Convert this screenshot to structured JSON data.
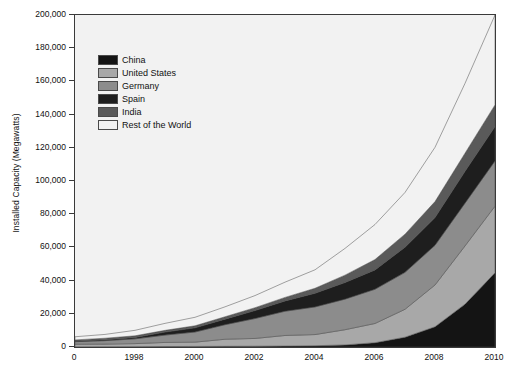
{
  "chart_data": {
    "type": "area",
    "title": "",
    "subtitle": "",
    "xlabel": "",
    "ylabel": "Installed Capacity (Megawatts)",
    "stacked": true,
    "grid": false,
    "legend_position": "inside-top-left",
    "xlim": [
      1996,
      2010
    ],
    "ylim": [
      0,
      200000
    ],
    "x": [
      1996,
      1997,
      1998,
      1999,
      2000,
      2001,
      2002,
      2003,
      2004,
      2005,
      2006,
      2007,
      2008,
      2009,
      2010
    ],
    "xtick_labels": [
      "0",
      "1998",
      "2000",
      "2002",
      "2004",
      "2006",
      "2008",
      "2010"
    ],
    "xtick_values": [
      1996,
      1998,
      2000,
      2002,
      2004,
      2006,
      2008,
      2010
    ],
    "ytick_labels": [
      "0",
      "20,000",
      "40,000",
      "60,000",
      "80,000",
      "100,000",
      "120,000",
      "140,000",
      "160,000",
      "180,000",
      "200,000"
    ],
    "ytick_values": [
      0,
      20000,
      40000,
      60000,
      80000,
      100000,
      120000,
      140000,
      160000,
      180000,
      200000
    ],
    "series": [
      {
        "name": "China",
        "color": "#141414",
        "values": [
          79,
          146,
          224,
          268,
          346,
          402,
          469,
          567,
          764,
          1266,
          2599,
          5912,
          12200,
          25800,
          44700
        ]
      },
      {
        "name": "United States",
        "color": "#a8a8a8",
        "values": [
          1596,
          1611,
          1820,
          2473,
          2578,
          4275,
          4685,
          6372,
          6725,
          9149,
          11575,
          16819,
          25170,
          35086,
          40180
        ]
      },
      {
        "name": "Germany",
        "color": "#8c8c8c",
        "values": [
          1546,
          2081,
          2875,
          4442,
          6097,
          8754,
          11994,
          14609,
          16629,
          18415,
          20622,
          22247,
          23903,
          25777,
          27214
        ]
      },
      {
        "name": "Spain",
        "color": "#1e1e1e",
        "values": [
          249,
          512,
          834,
          1812,
          2535,
          3337,
          4825,
          6203,
          8264,
          10028,
          11630,
          15145,
          16740,
          19149,
          20676
        ]
      },
      {
        "name": "India",
        "color": "#5a5a5a",
        "values": [
          820,
          940,
          992,
          1035,
          1220,
          1456,
          1702,
          2125,
          3000,
          4430,
          6270,
          7850,
          9587,
          10926,
          13065
        ]
      },
      {
        "name": "Rest of the World",
        "color": "#f2f2f2",
        "values": [
          1885,
          2290,
          3305,
          4210,
          5124,
          5976,
          7305,
          9184,
          11118,
          16112,
          21104,
          25127,
          32700,
          42062,
          54165
        ]
      }
    ]
  },
  "legend": {
    "items": [
      {
        "label": "China"
      },
      {
        "label": "United States"
      },
      {
        "label": "Germany"
      },
      {
        "label": "Spain"
      },
      {
        "label": "India"
      },
      {
        "label": "Rest of the World"
      }
    ]
  }
}
